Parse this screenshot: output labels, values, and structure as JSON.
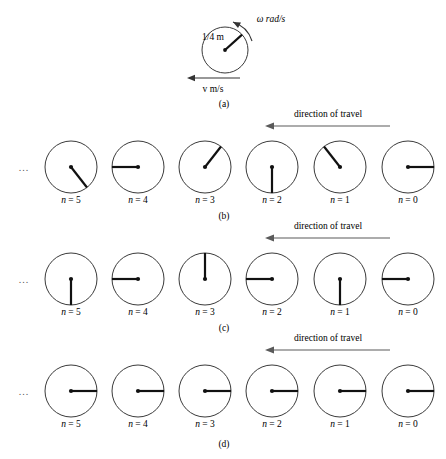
{
  "figure": {
    "title_panels": [
      "(a)",
      "(b)",
      "(c)",
      "(d)"
    ],
    "ellipsis": "...",
    "travel_label": "direction of travel"
  },
  "panel_a": {
    "letter": "(a)",
    "radius_label": "1/4 m",
    "omega_label": "ω rad/s",
    "velocity_label": "v m/s",
    "circle": {
      "cx": 225,
      "cy": 50,
      "r": 23
    },
    "spoke_angle_deg": 42,
    "omega_direction": "counterclockwise",
    "velocity_direction": "left"
  },
  "panel_b": {
    "letter": "(b)",
    "travel_label": "direction of travel",
    "wheels": [
      {
        "label": "n = 5",
        "n": 5,
        "angle_deg": -52
      },
      {
        "label": "n = 4",
        "n": 4,
        "angle_deg": 180
      },
      {
        "label": "n = 3",
        "n": 3,
        "angle_deg": 52
      },
      {
        "label": "n = 2",
        "n": 2,
        "angle_deg": -90
      },
      {
        "label": "n = 1",
        "n": 1,
        "angle_deg": 128
      },
      {
        "label": "n = 0",
        "n": 0,
        "angle_deg": 0
      }
    ]
  },
  "panel_c": {
    "letter": "(c)",
    "travel_label": "direction of travel",
    "wheels": [
      {
        "label": "n = 5",
        "n": 5,
        "angle_deg": -90
      },
      {
        "label": "n = 4",
        "n": 4,
        "angle_deg": 180
      },
      {
        "label": "n = 3",
        "n": 3,
        "angle_deg": 90
      },
      {
        "label": "n = 2",
        "n": 2,
        "angle_deg": 180
      },
      {
        "label": "n = 1",
        "n": 1,
        "angle_deg": -90
      },
      {
        "label": "n = 0",
        "n": 0,
        "angle_deg": 180
      }
    ]
  },
  "panel_d": {
    "letter": "(d)",
    "travel_label": "direction of travel",
    "wheels": [
      {
        "label": "n = 5",
        "n": 5,
        "angle_deg": 0
      },
      {
        "label": "n = 4",
        "n": 4,
        "angle_deg": 0
      },
      {
        "label": "n = 3",
        "n": 3,
        "angle_deg": 0
      },
      {
        "label": "n = 2",
        "n": 2,
        "angle_deg": 0
      },
      {
        "label": "n = 1",
        "n": 1,
        "angle_deg": 0
      },
      {
        "label": "n = 0",
        "n": 0,
        "angle_deg": 0
      }
    ]
  },
  "layout": {
    "centers_x": [
      71,
      138,
      205,
      272,
      340,
      408
    ],
    "row_cy": {
      "b": 167,
      "c": 279,
      "d": 391
    },
    "wheel_radius": 26,
    "label_dy": 36,
    "arrow_x_start": 390,
    "arrow_x_end": 266,
    "arrow_rows_y": {
      "b": 126,
      "c": 238,
      "d": 350
    },
    "travel_text_y": {
      "b": 117,
      "c": 229,
      "d": 341
    },
    "panel_letter_y": {
      "a": 107,
      "b": 219,
      "c": 331,
      "d": 447
    },
    "ellipsis_x": 24
  },
  "colors": {
    "circle_stroke": "#3a3a3a",
    "spoke": "#111111",
    "arrow": "#5a5a5a",
    "text": "#000000",
    "background": "#ffffff"
  }
}
